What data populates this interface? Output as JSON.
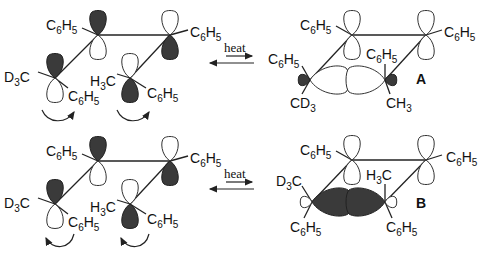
{
  "figure": {
    "heat_label": "heat",
    "rows": [
      {
        "id": "row-A",
        "reactant": {
          "labels": [
            "C6H5",
            "C6H5",
            "D3C",
            "C6H5",
            "H3C",
            "C6H5"
          ],
          "rotation": "both-clockwise"
        },
        "product": {
          "name": "A",
          "labels": [
            "C6H5",
            "C6H5",
            "C6H5",
            "C6H5",
            "CD3",
            "CH3"
          ]
        }
      },
      {
        "id": "row-B",
        "reactant": {
          "labels": [
            "C6H5",
            "C6H5",
            "D3C",
            "C6H5",
            "H3C",
            "C6H5"
          ],
          "rotation": "both-counterclockwise"
        },
        "product": {
          "name": "B",
          "labels": [
            "C6H5",
            "C6H5",
            "D3C",
            "H3C",
            "C6H5",
            "C6H5"
          ]
        }
      }
    ],
    "colors": {
      "filled_lobe": "#3a3a3a",
      "line": "#222222",
      "background": "#ffffff"
    }
  }
}
